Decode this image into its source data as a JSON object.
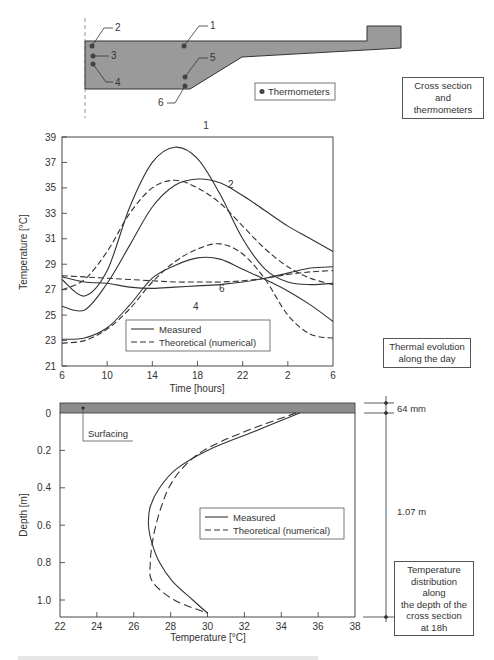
{
  "cross_section": {
    "thermometer_labels": [
      "1",
      "2",
      "3",
      "4",
      "5",
      "6"
    ],
    "legend_label": "Thermometers",
    "caption_box": "Cross section and thermometers"
  },
  "colors": {
    "concrete_fill": "#9a9a9a",
    "line": "#333333",
    "surfacing_fill": "#8c8c8c"
  },
  "chart_data": [
    {
      "type": "line",
      "title": "Thermal evolution along the day",
      "xlabel": "Time [hours]",
      "ylabel": "Temperature [°C]",
      "x_ticks": [
        "6",
        "10",
        "14",
        "18",
        "22",
        "2",
        "6"
      ],
      "y_ticks": [
        21,
        23,
        25,
        27,
        29,
        31,
        33,
        35,
        37,
        39
      ],
      "ylim": [
        21,
        39
      ],
      "x_hours_elapsed": [
        0,
        2,
        4,
        6,
        8,
        10,
        12,
        14,
        16,
        18,
        20,
        22,
        24
      ],
      "legend": [
        "Measured",
        "Theoretical (numerical)"
      ],
      "legend_position": "lower-left inside",
      "curve_labels": [
        "1",
        "2",
        "6",
        "4"
      ],
      "series": [
        {
          "name": "1 Measured",
          "style": "solid",
          "values": [
            27.8,
            26.5,
            28.5,
            33.5,
            37.0,
            38.2,
            37.3,
            34.5,
            31.0,
            28.6,
            27.6,
            27.4,
            27.5
          ]
        },
        {
          "name": "1 Theoretical",
          "style": "dashed",
          "values": [
            27.0,
            27.8,
            30.0,
            33.0,
            35.0,
            35.6,
            35.0,
            33.8,
            32.0,
            30.2,
            28.8,
            27.9,
            27.4
          ]
        },
        {
          "name": "2 Measured",
          "style": "solid",
          "values": [
            25.7,
            25.4,
            27.5,
            30.5,
            33.5,
            35.2,
            35.7,
            35.4,
            34.4,
            33.2,
            32.0,
            31.0,
            30.0
          ]
        },
        {
          "name": "6 Measured",
          "style": "solid",
          "values": [
            23.1,
            23.2,
            24.0,
            25.8,
            27.9,
            28.9,
            29.5,
            29.4,
            28.6,
            27.8,
            26.9,
            25.8,
            24.5
          ]
        },
        {
          "name": "6 Theoretical",
          "style": "dashed",
          "values": [
            22.8,
            23.0,
            23.9,
            25.5,
            27.6,
            29.2,
            30.2,
            30.6,
            29.8,
            27.8,
            25.0,
            23.5,
            23.2
          ]
        },
        {
          "name": "4 Measured",
          "style": "solid",
          "values": [
            28.0,
            27.6,
            27.5,
            27.2,
            27.1,
            27.2,
            27.3,
            27.4,
            27.6,
            27.9,
            28.3,
            28.7,
            28.8
          ]
        },
        {
          "name": "4 Theoretical",
          "style": "dashed",
          "values": [
            28.1,
            28.0,
            27.9,
            27.8,
            27.7,
            27.6,
            27.6,
            27.6,
            27.7,
            27.9,
            28.2,
            28.4,
            28.5
          ]
        }
      ],
      "caption_box": "Thermal evolution along the day"
    },
    {
      "type": "line",
      "title": "Temperature distribution along the depth of the cross section at 18h",
      "xlabel": "Temperature [°C]",
      "ylabel": "Depth [m]",
      "x_ticks": [
        22,
        24,
        26,
        28,
        30,
        32,
        34,
        36,
        38
      ],
      "y_ticks": [
        "0",
        "0.2",
        "0.4",
        "0.6",
        "0.8",
        "1.0"
      ],
      "xlim": [
        22,
        38
      ],
      "ylim": [
        1.07,
        0
      ],
      "legend": [
        "Measured",
        "Theoretical (numerical)"
      ],
      "legend_position": "center-right inside",
      "series": [
        {
          "name": "Measured",
          "style": "solid",
          "depth": [
            0,
            0.1,
            0.2,
            0.3,
            0.4,
            0.5,
            0.6,
            0.7,
            0.8,
            0.9,
            1.0,
            1.07
          ],
          "values": [
            35.0,
            32.5,
            30.0,
            28.3,
            27.4,
            26.9,
            26.8,
            27.0,
            27.4,
            28.1,
            29.2,
            30.0
          ]
        },
        {
          "name": "Theoretical (numerical)",
          "style": "dashed",
          "depth": [
            0,
            0.1,
            0.2,
            0.3,
            0.4,
            0.5,
            0.6,
            0.7,
            0.8,
            0.9,
            1.0,
            1.07
          ],
          "values": [
            34.8,
            32.0,
            29.8,
            28.6,
            27.9,
            27.5,
            27.2,
            27.0,
            26.9,
            27.0,
            28.2,
            30.0
          ]
        }
      ],
      "annotations": {
        "surfacing_label": "Surfacing",
        "surfacing_thickness": "64 mm",
        "slab_depth": "1.07 m"
      },
      "caption_box": "Temperature distribution along the depth of the cross section at 18h"
    }
  ],
  "boxes": {
    "cross_section": [
      "Cross section and",
      "thermometers"
    ],
    "thermal": [
      "Thermal evolution",
      "along the day"
    ],
    "depth": [
      "Temperature",
      "distribution along",
      "the depth of the",
      "cross section",
      "at 18h"
    ]
  }
}
